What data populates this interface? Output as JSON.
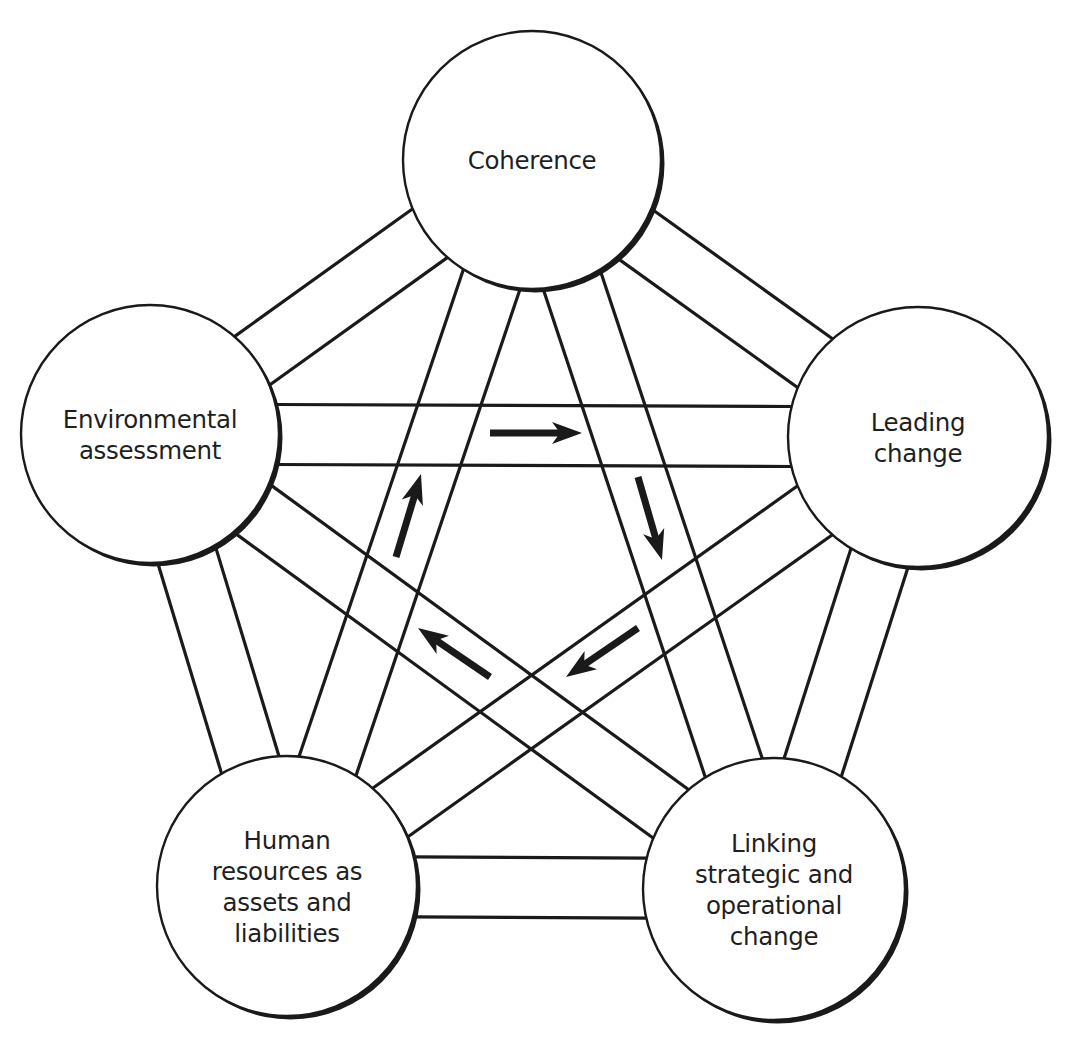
{
  "diagram": {
    "type": "pentagon-network",
    "colors": {
      "stroke": "#1a1a1a",
      "fill": "#ffffff",
      "text": "#1f1f1f"
    },
    "band_half_width": 30,
    "nodes": [
      {
        "id": "coherence",
        "cx": 532,
        "cy": 160,
        "r": 129,
        "lines": [
          "Coherence"
        ]
      },
      {
        "id": "environmental-assessment",
        "cx": 150,
        "cy": 434,
        "r": 129,
        "lines": [
          "Environmental",
          "assessment"
        ]
      },
      {
        "id": "leading-change",
        "cx": 918,
        "cy": 437,
        "r": 130,
        "lines": [
          "Leading",
          "change"
        ]
      },
      {
        "id": "human-resources",
        "cx": 287,
        "cy": 886,
        "r": 130,
        "lines": [
          "Human",
          "resources as",
          "assets and",
          "liabilities"
        ]
      },
      {
        "id": "linking-change",
        "cx": 774,
        "cy": 889,
        "r": 131,
        "lines": [
          "Linking",
          "strategic and",
          "operational",
          "change"
        ]
      }
    ],
    "connections": [
      [
        "coherence",
        "environmental-assessment"
      ],
      [
        "coherence",
        "leading-change"
      ],
      [
        "coherence",
        "human-resources"
      ],
      [
        "coherence",
        "linking-change"
      ],
      [
        "environmental-assessment",
        "leading-change"
      ],
      [
        "environmental-assessment",
        "human-resources"
      ],
      [
        "environmental-assessment",
        "linking-change"
      ],
      [
        "leading-change",
        "human-resources"
      ],
      [
        "leading-change",
        "linking-change"
      ],
      [
        "human-resources",
        "linking-change"
      ]
    ],
    "cycle_arrows": [
      {
        "direction": "right",
        "from": [
          490,
          433
        ],
        "to": [
          582,
          433
        ]
      },
      {
        "direction": "down-right",
        "from": [
          638,
          477
        ],
        "to": [
          662,
          560
        ]
      },
      {
        "direction": "down-left",
        "from": [
          638,
          628
        ],
        "to": [
          566,
          677
        ]
      },
      {
        "direction": "up-left",
        "from": [
          490,
          677
        ],
        "to": [
          418,
          628
        ]
      },
      {
        "direction": "up-right",
        "from": [
          396,
          557
        ],
        "to": [
          421,
          474
        ]
      }
    ]
  }
}
